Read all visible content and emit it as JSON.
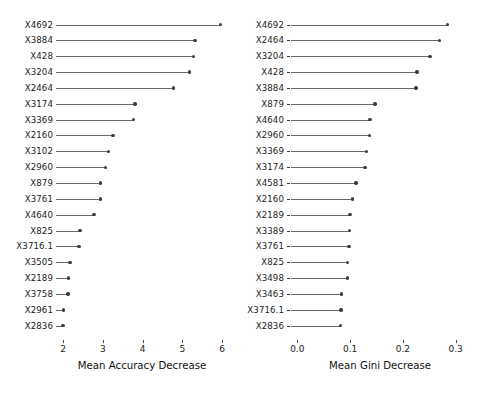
{
  "figure": {
    "type": "variable-importance-dotchart",
    "background": "#ffffff",
    "dot_color": "#3d3d3d",
    "line_color": "#6a6a6a"
  },
  "chart_data": [
    {
      "type": "scatter",
      "panel_id": "accuracy",
      "title": "",
      "xlabel": "Mean Accuracy Decrease",
      "ylabel": "",
      "xlim": [
        1.95,
        6.1
      ],
      "xticks": [
        2,
        3,
        4,
        5,
        6
      ],
      "xtick_labels": [
        "2",
        "3",
        "4",
        "5",
        "6"
      ],
      "grid": false,
      "legend": null,
      "orientation": "horizontal-lollipop",
      "categories": [
        "X4692",
        "X3884",
        "X428",
        "X3204",
        "X2464",
        "X3174",
        "X3369",
        "X2160",
        "X3102",
        "X2960",
        "X879",
        "X3761",
        "X4640",
        "X825",
        "X3716.1",
        "X3505",
        "X2189",
        "X3758",
        "X2961",
        "X2836"
      ],
      "values": [
        5.96,
        5.32,
        5.29,
        5.19,
        4.78,
        3.81,
        3.77,
        3.26,
        3.14,
        3.07,
        2.95,
        2.94,
        2.78,
        2.43,
        2.4,
        2.18,
        2.14,
        2.13,
        2.02,
        2.0
      ]
    },
    {
      "type": "scatter",
      "panel_id": "gini",
      "title": "",
      "xlabel": "Mean Gini Decrease",
      "ylabel": "",
      "xlim": [
        0.075,
        0.305
      ],
      "xticks": [
        0.0,
        0.1,
        0.2,
        0.3
      ],
      "xtick_labels": [
        "0.0",
        "0.1",
        "0.2",
        "0.3"
      ],
      "grid": false,
      "legend": null,
      "orientation": "horizontal-lollipop",
      "categories": [
        "X4692",
        "X2464",
        "X3204",
        "X428",
        "X3884",
        "X879",
        "X4640",
        "X2960",
        "X3369",
        "X3174",
        "X4581",
        "X2160",
        "X2189",
        "X3389",
        "X3761",
        "X825",
        "X3498",
        "X3463",
        "X3716.1",
        "X2836"
      ],
      "values": [
        0.285,
        0.269,
        0.251,
        0.227,
        0.225,
        0.147,
        0.138,
        0.137,
        0.131,
        0.128,
        0.111,
        0.104,
        0.1,
        0.0985,
        0.098,
        0.0955,
        0.0947,
        0.084,
        0.083,
        0.082
      ]
    }
  ]
}
